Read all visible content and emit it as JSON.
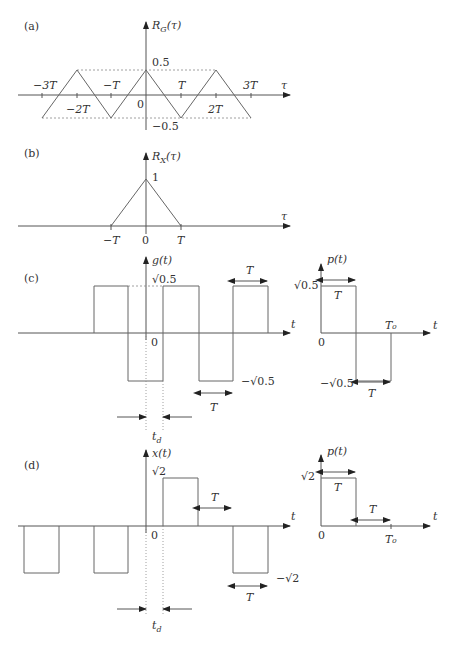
{
  "panels": {
    "a": {
      "tag": "(a)",
      "ylabel": "R_G(τ)",
      "xlabel": "τ",
      "top_value": "0.5",
      "bottom_value": "−0.5",
      "origin": "0",
      "ticks_upper": [
        "−3T",
        "−T",
        "T",
        "3T"
      ],
      "ticks_lower": [
        "−2T",
        "2T"
      ]
    },
    "b": {
      "tag": "(b)",
      "ylabel": "R_X(τ)",
      "xlabel": "τ",
      "peak_value": "1",
      "ticks": [
        "−T",
        "0",
        "T"
      ]
    },
    "c": {
      "tag": "(c)",
      "ylabel": "g(t)",
      "xlabel": "t",
      "top_value": "√0.5",
      "bottom_value": "−√0.5",
      "origin": "0",
      "period_label_top": "T",
      "period_label_bottom": "T",
      "delay_label": "t_d",
      "pulse": {
        "ylabel": "p(t)",
        "xlabel": "t",
        "top_value": "√0.5",
        "bottom_value": "−√0.5",
        "origin": "0",
        "T0": "T₀",
        "T_top": "T",
        "T_bottom": "T"
      }
    },
    "d": {
      "tag": "(d)",
      "ylabel": "x(t)",
      "xlabel": "t",
      "top_value": "√2",
      "bottom_value": "−√2",
      "origin": "0",
      "period_label_top": "T",
      "period_label_bottom": "T",
      "delay_label": "t_d",
      "pulse": {
        "ylabel": "p(t)",
        "xlabel": "t",
        "top_value": "√2",
        "origin": "0",
        "T0": "T₀",
        "T_top": "T",
        "T_right": "T"
      }
    }
  }
}
